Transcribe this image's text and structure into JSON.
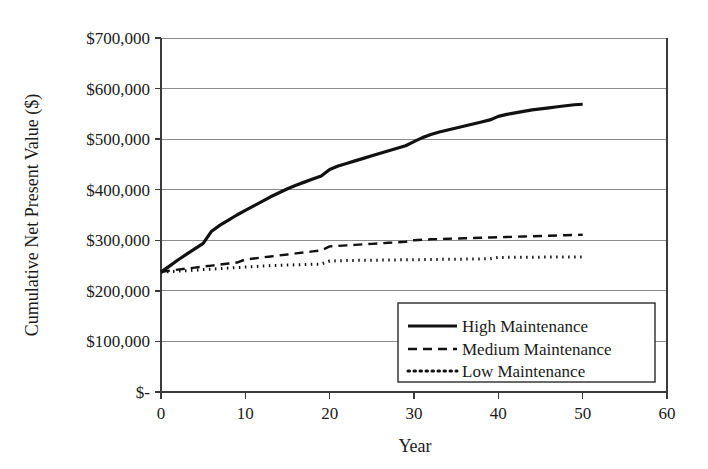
{
  "chart_data": {
    "type": "line",
    "title": "",
    "xlabel": "Year",
    "ylabel": "Cumulative Net Present Value ($)",
    "xlim": [
      0,
      60
    ],
    "ylim": [
      0,
      700000
    ],
    "grid": "horizontal",
    "legend_position": "bottom-right",
    "x_tick_labels": [
      "0",
      "10",
      "20",
      "30",
      "40",
      "50",
      "60"
    ],
    "x_ticks": [
      0,
      10,
      20,
      30,
      40,
      50,
      60
    ],
    "y_tick_labels": [
      "$700,000",
      "$600,000",
      "$500,000",
      "$400,000",
      "$300,000",
      "$200,000",
      "$100,000",
      "$-"
    ],
    "y_ticks": [
      700000,
      600000,
      500000,
      400000,
      300000,
      200000,
      100000,
      0
    ],
    "x": [
      0,
      1,
      2,
      3,
      4,
      5,
      6,
      7,
      8,
      9,
      10,
      11,
      12,
      13,
      14,
      15,
      16,
      17,
      18,
      19,
      20,
      21,
      22,
      23,
      24,
      25,
      26,
      27,
      28,
      29,
      30,
      31,
      32,
      33,
      34,
      35,
      36,
      37,
      38,
      39,
      40,
      41,
      42,
      43,
      44,
      45,
      46,
      47,
      48,
      49,
      50
    ],
    "series": [
      {
        "name": "High Maintenance",
        "style": "solid",
        "color": "#111111",
        "values": [
          237000,
          249000,
          261000,
          272000,
          283000,
          294000,
          318000,
          330000,
          340000,
          350000,
          359000,
          368000,
          377000,
          386000,
          394000,
          402000,
          409000,
          415000,
          421000,
          427000,
          440000,
          447000,
          452000,
          457000,
          462000,
          467000,
          472000,
          477000,
          482000,
          487000,
          495000,
          503000,
          509000,
          514000,
          518000,
          522000,
          526000,
          530000,
          534000,
          538000,
          545000,
          549000,
          552000,
          555000,
          558000,
          560000,
          562000,
          564000,
          566000,
          568000,
          569000
        ]
      },
      {
        "name": "Medium Maintenance",
        "style": "dashed",
        "color": "#111111",
        "values": [
          237000,
          240000,
          242000,
          244000,
          246000,
          248000,
          250000,
          252000,
          254000,
          256000,
          262000,
          264000,
          266000,
          268000,
          270000,
          272000,
          274000,
          276000,
          278000,
          280000,
          288000,
          289000,
          290000,
          291000,
          292000,
          293000,
          294000,
          295000,
          296000,
          297000,
          300000,
          301000,
          302000,
          302500,
          303000,
          303500,
          304000,
          304500,
          305000,
          305500,
          306000,
          306500,
          307000,
          307500,
          308000,
          308500,
          309000,
          309500,
          310000,
          310500,
          311000
        ]
      },
      {
        "name": "Low Maintenance",
        "style": "dotted",
        "color": "#111111",
        "values": [
          237000,
          238000,
          239000,
          240000,
          241000,
          242000,
          243000,
          244000,
          245000,
          246000,
          247000,
          248000,
          249000,
          250000,
          250500,
          251000,
          251500,
          252000,
          252500,
          253000,
          259000,
          259500,
          260000,
          260200,
          260400,
          260600,
          260800,
          261000,
          261200,
          261400,
          261600,
          261800,
          262000,
          262200,
          262400,
          262600,
          262800,
          263000,
          263200,
          263400,
          266000,
          266200,
          266400,
          266500,
          266600,
          266700,
          266800,
          266900,
          267000,
          267000,
          267000
        ]
      }
    ]
  },
  "legend": {
    "items": [
      {
        "label": "High Maintenance",
        "style": "solid"
      },
      {
        "label": "Medium Maintenance",
        "style": "dashed"
      },
      {
        "label": "Low Maintenance",
        "style": "dotted"
      }
    ]
  }
}
